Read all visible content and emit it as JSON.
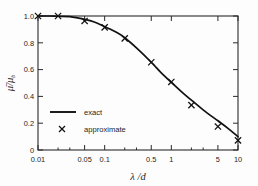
{
  "chart_data": {
    "type": "line",
    "title": "",
    "subtitle": "",
    "xlabel": "λ /d",
    "ylabel": "μ̄/μ_b",
    "ylabel_main": "μ̄/μ",
    "ylabel_sub": "b",
    "xscale": "log",
    "yscale": "linear",
    "xlim": [
      0.01,
      10
    ],
    "ylim": [
      0,
      1.0
    ],
    "grid": false,
    "legend_position": "lower-left-inside",
    "xticks": [
      0.01,
      0.05,
      0.1,
      0.5,
      1,
      5,
      10
    ],
    "xticklabels": [
      "0.01",
      "0.05",
      "0.1",
      "0.5",
      "1",
      "5",
      "10"
    ],
    "yticks": [
      0,
      0.2,
      0.4,
      0.6,
      0.8,
      1.0
    ],
    "yticklabels": [
      "0",
      "0.2",
      "0.4",
      "0.6",
      "0.8",
      "1.0"
    ],
    "series": [
      {
        "name": "exact",
        "style": "solid-line",
        "x": [
          0.01,
          0.015,
          0.02,
          0.03,
          0.05,
          0.07,
          0.1,
          0.15,
          0.2,
          0.3,
          0.5,
          0.7,
          1.0,
          1.5,
          2.0,
          3.0,
          5.0,
          7.0,
          10.0
        ],
        "y": [
          1.0,
          1.0,
          0.998,
          0.995,
          0.975,
          0.955,
          0.92,
          0.878,
          0.838,
          0.762,
          0.655,
          0.578,
          0.505,
          0.425,
          0.372,
          0.3,
          0.218,
          0.163,
          0.1
        ]
      },
      {
        "name": "approximate",
        "style": "x-markers",
        "x": [
          0.01,
          0.02,
          0.05,
          0.1,
          0.2,
          0.5,
          1.0,
          2.0,
          5.0,
          10.0
        ],
        "y": [
          1.0,
          1.0,
          0.963,
          0.915,
          0.833,
          0.655,
          0.508,
          0.335,
          0.175,
          0.072
        ]
      }
    ],
    "legend": [
      {
        "label": "exact",
        "marker": "line"
      },
      {
        "label": "approximate",
        "marker": "x"
      }
    ],
    "colors": {
      "curve": "#111111",
      "axis": "#2b2b2b",
      "background": "#fdfdfd"
    }
  }
}
